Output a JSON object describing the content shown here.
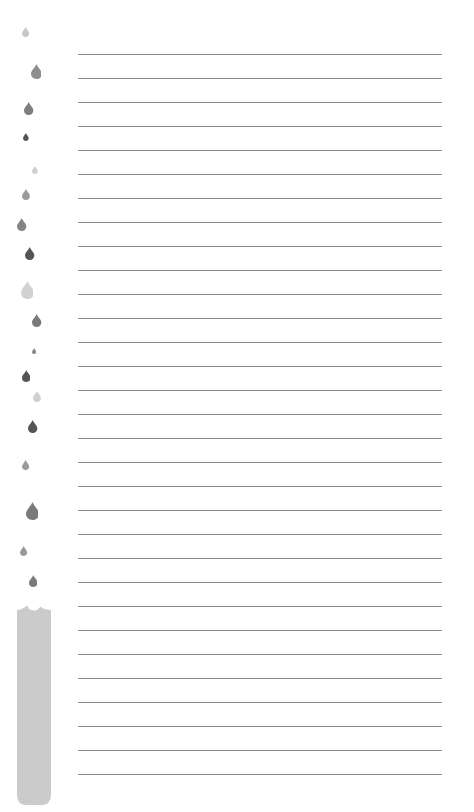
{
  "page": {
    "type": "lined-notepaper",
    "background": "#ffffff",
    "line_color": "#8c8c8c",
    "line_count": 31,
    "line_start_y": 54,
    "line_spacing": 24,
    "line_left": 78,
    "line_right": 442
  },
  "decoration": {
    "drop_icon": "water-drop-icon",
    "drops": [
      {
        "x": 26,
        "y": 32,
        "size": 10,
        "color": "#c8c8c8"
      },
      {
        "x": 36,
        "y": 71,
        "size": 15,
        "color": "#8e8e8e"
      },
      {
        "x": 29,
        "y": 108,
        "size": 13,
        "color": "#7e7e7e"
      },
      {
        "x": 26,
        "y": 137,
        "size": 8,
        "color": "#555555"
      },
      {
        "x": 35,
        "y": 170,
        "size": 8,
        "color": "#cfcfcf"
      },
      {
        "x": 26,
        "y": 194,
        "size": 11,
        "color": "#9a9a9a"
      },
      {
        "x": 22,
        "y": 224,
        "size": 13,
        "color": "#858585"
      },
      {
        "x": 30,
        "y": 253,
        "size": 13,
        "color": "#555555"
      },
      {
        "x": 27,
        "y": 290,
        "size": 18,
        "color": "#d2d2d2"
      },
      {
        "x": 37,
        "y": 320,
        "size": 13,
        "color": "#7a7a7a"
      },
      {
        "x": 34,
        "y": 351,
        "size": 6,
        "color": "#8a8a8a"
      },
      {
        "x": 26,
        "y": 376,
        "size": 12,
        "color": "#555555"
      },
      {
        "x": 37,
        "y": 396,
        "size": 11,
        "color": "#d0d0d0"
      },
      {
        "x": 33,
        "y": 426,
        "size": 13,
        "color": "#555555"
      },
      {
        "x": 26,
        "y": 465,
        "size": 10,
        "color": "#9a9a9a"
      },
      {
        "x": 32,
        "y": 511,
        "size": 18,
        "color": "#7a7a7a"
      },
      {
        "x": 24,
        "y": 551,
        "size": 10,
        "color": "#9a9a9a"
      },
      {
        "x": 33,
        "y": 581,
        "size": 12,
        "color": "#7a7a7a"
      }
    ],
    "gauge_bar": {
      "color": "#cbcbcb",
      "label": "water-level-bar"
    }
  }
}
